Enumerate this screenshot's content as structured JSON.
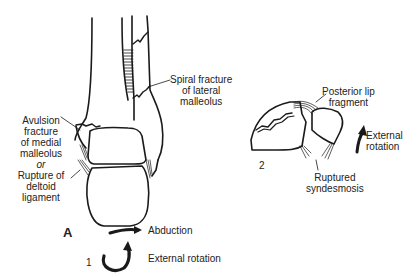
{
  "figure": {
    "panel_letter": "A",
    "stage1": {
      "number": "1",
      "labels": {
        "spiral_fracture": [
          "Spiral fracture",
          "of lateral",
          "malleolus"
        ],
        "avulsion": [
          "Avulsion",
          "fracture",
          "of medial",
          "malleolus",
          "or",
          "Rupture of",
          "deltoid",
          "ligament"
        ],
        "abduction": "Abduction",
        "external_rotation": "External rotation"
      },
      "icons": [
        "abduction-arrow-icon",
        "external-rotation-curved-arrow-icon"
      ]
    },
    "stage2": {
      "number": "2",
      "labels": {
        "posterior_lip": [
          "Posterior lip",
          "fragment"
        ],
        "external_rotation": [
          "External",
          "rotation"
        ],
        "syndesmosis": [
          "Ruptured",
          "syndesmosis"
        ]
      },
      "icons": [
        "external-rotation-arrow-icon"
      ]
    },
    "colors": {
      "line": "#1a1a1a",
      "background": "#ffffff"
    }
  }
}
